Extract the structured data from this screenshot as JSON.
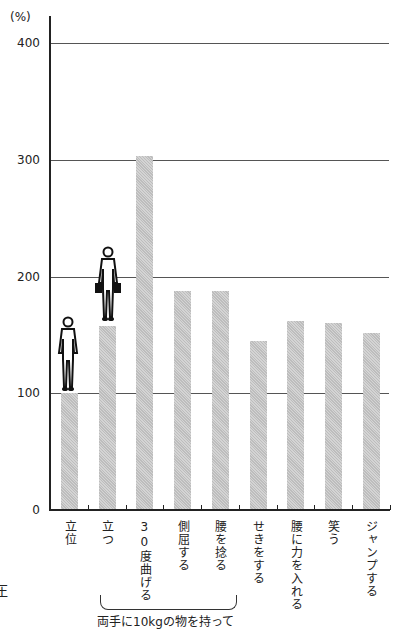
{
  "chart_data": {
    "type": "bar",
    "title": "",
    "xlabel": "",
    "ylabel": "(%)",
    "ylim": [
      0,
      400
    ],
    "yticks": [
      0,
      100,
      200,
      300,
      400
    ],
    "grid": true,
    "categories": [
      "立位",
      "立つ",
      "30度曲げる",
      "側屈する",
      "腰を捻る",
      "せきをする",
      "腰に力を入れる",
      "笑う",
      "ジャンプする"
    ],
    "values": [
      100,
      158,
      303,
      188,
      188,
      145,
      162,
      160,
      152
    ],
    "group_annotation": {
      "label": "両手に10kgの物を持って",
      "categories": [
        "立つ",
        "30度曲げる",
        "側屈する",
        "腰を捻る"
      ]
    },
    "icons": [
      {
        "category": "立位",
        "name": "standing-person-icon"
      },
      {
        "category": "立つ",
        "name": "person-holding-weights-icon"
      }
    ]
  },
  "axis": {
    "unit": "(%)",
    "ticks": [
      "400",
      "300",
      "200",
      "100",
      "0"
    ]
  },
  "group_label": "両手に10kgの物を持って",
  "edge_text": "圧"
}
